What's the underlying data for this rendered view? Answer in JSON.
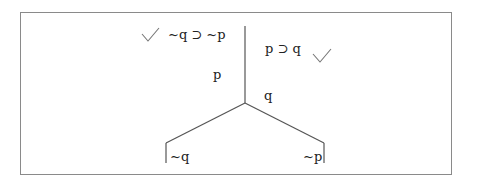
{
  "diagram": {
    "type": "truth-tree",
    "colors": {
      "border": "#8a8a8a",
      "lines": "#555555",
      "text": "#222222",
      "check": "#777777"
    },
    "premises": [
      {
        "formula": "~q ⊃ ~p",
        "checked": true,
        "check_side": "left"
      },
      {
        "formula": "p ⊃ q",
        "checked": true,
        "check_side": "right"
      }
    ],
    "trunk_labels": {
      "left": "p",
      "right": "q"
    },
    "branches": [
      {
        "label": "~q",
        "side": "left"
      },
      {
        "label": "~p",
        "side": "right"
      }
    ],
    "check_icon": "checkmark"
  }
}
